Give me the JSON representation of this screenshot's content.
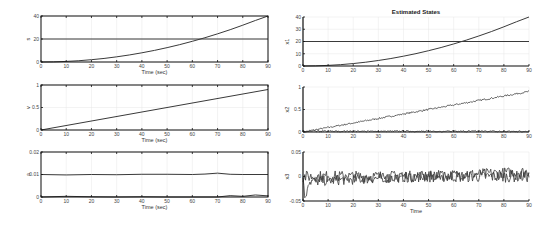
{
  "chart_data": [
    {
      "id": "left-1",
      "type": "line",
      "title": "",
      "xlabel": "Time (sec)",
      "ylabel": "s",
      "xlim": [
        0,
        90
      ],
      "ylim": [
        0,
        40
      ],
      "xticks": [
        0,
        10,
        20,
        30,
        40,
        50,
        60,
        70,
        80,
        90
      ],
      "yticks": [
        0,
        20,
        40
      ],
      "grid": true,
      "series": [
        {
          "name": "s",
          "x": [
            0,
            5,
            10,
            15,
            20,
            25,
            30,
            35,
            40,
            45,
            50,
            55,
            60,
            65,
            70,
            75,
            80,
            85,
            90
          ],
          "values": [
            0,
            0.12,
            0.5,
            1.1,
            2.0,
            3.1,
            4.5,
            6.1,
            8.0,
            10.1,
            12.5,
            15.1,
            18.0,
            21.1,
            24.5,
            28.1,
            32.0,
            36.1,
            40.0
          ]
        },
        {
          "name": "reference",
          "x": [
            0,
            90
          ],
          "values": [
            20,
            20
          ]
        }
      ]
    },
    {
      "id": "left-2",
      "type": "line",
      "title": "",
      "xlabel": "Time (sec)",
      "ylabel": "v",
      "xlim": [
        0,
        90
      ],
      "ylim": [
        0,
        1
      ],
      "xticks": [
        0,
        10,
        20,
        30,
        40,
        50,
        60,
        70,
        80,
        90
      ],
      "yticks": [
        0,
        0.5,
        1
      ],
      "grid": true,
      "series": [
        {
          "name": "v",
          "x": [
            0,
            90
          ],
          "values": [
            0,
            0.9
          ]
        }
      ]
    },
    {
      "id": "left-3",
      "type": "line",
      "title": "",
      "xlabel": "Time (sec)",
      "ylabel": "a",
      "xlim": [
        0,
        90
      ],
      "ylim": [
        0,
        0.02
      ],
      "xticks": [
        0,
        10,
        20,
        30,
        40,
        50,
        60,
        70,
        80,
        90
      ],
      "yticks": [
        0,
        0.01,
        0.02
      ],
      "grid": true,
      "series": [
        {
          "name": "a",
          "x": [
            0,
            10,
            20,
            30,
            40,
            50,
            60,
            65,
            70,
            75,
            80,
            90
          ],
          "values": [
            0.01,
            0.0098,
            0.01,
            0.0099,
            0.0101,
            0.0101,
            0.01,
            0.0102,
            0.0106,
            0.0101,
            0.01,
            0.01
          ]
        },
        {
          "name": "a-error",
          "x": [
            0,
            10,
            20,
            30,
            40,
            50,
            60,
            70,
            75,
            80,
            85,
            90
          ],
          "values": [
            0,
            0.0003,
            0.0001,
            0,
            0.0001,
            0,
            0,
            0,
            0.0006,
            0.0003,
            0.0009,
            0.0005
          ]
        }
      ]
    },
    {
      "id": "right-1",
      "type": "line",
      "title": "Estimated States",
      "xlabel": "",
      "ylabel": "x1",
      "xlim": [
        0,
        90
      ],
      "ylim": [
        0,
        40
      ],
      "xticks": [
        0,
        10,
        20,
        30,
        40,
        50,
        60,
        70,
        80,
        90
      ],
      "yticks": [
        0,
        10,
        20,
        30,
        40
      ],
      "grid": true,
      "series": [
        {
          "name": "x1",
          "x": [
            0,
            5,
            10,
            15,
            20,
            25,
            30,
            35,
            40,
            45,
            50,
            55,
            60,
            65,
            70,
            75,
            80,
            85,
            90
          ],
          "values": [
            0,
            0.12,
            0.5,
            1.1,
            2.0,
            3.1,
            4.5,
            6.1,
            8.0,
            10.1,
            12.5,
            15.1,
            18.0,
            21.1,
            24.5,
            28.1,
            32.0,
            36.1,
            40.0
          ]
        },
        {
          "name": "reference",
          "x": [
            0,
            90
          ],
          "values": [
            20,
            20
          ]
        }
      ]
    },
    {
      "id": "right-2",
      "type": "line",
      "title": "",
      "xlabel": "",
      "ylabel": "x2",
      "xlim": [
        0,
        90
      ],
      "ylim": [
        0,
        1
      ],
      "xticks": [
        0,
        10,
        20,
        30,
        40,
        50,
        60,
        70,
        80,
        90
      ],
      "yticks": [
        0,
        0.5,
        1
      ],
      "grid": true,
      "series": [
        {
          "name": "x2 (noisy estimate)",
          "x": [
            0,
            90
          ],
          "values": [
            0,
            0.9
          ],
          "noise": 0.02
        },
        {
          "name": "x2 error",
          "x": [
            0,
            90
          ],
          "values": [
            0.02,
            0.02
          ],
          "noise": 0.03
        }
      ]
    },
    {
      "id": "right-3",
      "type": "line",
      "title": "",
      "xlabel": "Time",
      "ylabel": "x3",
      "xlim": [
        0,
        90
      ],
      "ylim": [
        -0.05,
        0.05
      ],
      "xticks": [
        0,
        10,
        20,
        30,
        40,
        50,
        60,
        70,
        80,
        90
      ],
      "yticks": [
        -0.05,
        0,
        0.05
      ],
      "grid": true,
      "series": [
        {
          "name": "x3 estimate",
          "x": [
            0,
            1,
            2,
            90
          ],
          "values": [
            0,
            -0.05,
            -0.01,
            0.01
          ],
          "noise": 0.012
        },
        {
          "name": "x3 error",
          "x": [
            0,
            90
          ],
          "values": [
            0,
            0
          ],
          "noise": 0.012
        }
      ]
    }
  ],
  "layout": {
    "line_color": "#3a3a3a",
    "axis_color": "#111111",
    "grid_color": "#e6e6e6"
  }
}
